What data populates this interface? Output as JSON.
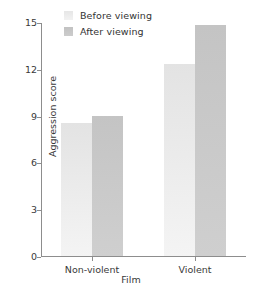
{
  "chart_data": {
    "type": "bar",
    "title": "",
    "subtitle": "",
    "xlabel": "Film",
    "ylabel": "Aggression score",
    "categories": [
      "Non-violent",
      "Violent"
    ],
    "series": [
      {
        "name": "Before viewing",
        "values": [
          8.5,
          12.3
        ],
        "color": "#e3e3e3"
      },
      {
        "name": "After viewing",
        "values": [
          9.0,
          14.8
        ],
        "color": "#c4c4c4"
      }
    ],
    "ylim": [
      0,
      15
    ],
    "yticks": [
      0,
      3,
      6,
      9,
      12,
      15
    ],
    "ytick_labels": [
      "0",
      "3",
      "6",
      "9",
      "12",
      "15"
    ],
    "grid": false,
    "legend_position": "top-left",
    "legend_entries": [
      "Before viewing",
      "After viewing"
    ],
    "annotations": []
  },
  "legend": {
    "entries": [
      {
        "label": "Before viewing",
        "swatch": "legend-swatch-before"
      },
      {
        "label": "After viewing",
        "swatch": "legend-swatch-after"
      }
    ]
  },
  "axes": {
    "y_title": "Aggression score",
    "x_title": "Film",
    "y_labels": [
      "15",
      "12",
      "9",
      "6",
      "3",
      "0"
    ],
    "x_labels": [
      "Non-violent",
      "Violent"
    ]
  },
  "colors": {
    "before_bar": "#e3e3e3",
    "before_bar_bottom": "#f4f4f4",
    "after_bar": "#c4c4c4",
    "after_bar_bottom": "#cfcfcf",
    "axis": "#8d8d8d",
    "text": "#3a3a3a",
    "background": "#ffffff"
  }
}
